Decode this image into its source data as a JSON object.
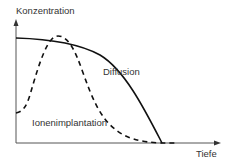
{
  "diagram": {
    "y_axis_label": "Konzentration",
    "x_axis_label": "Tiefe",
    "curves": [
      {
        "name": "Diffusion",
        "style": "solid",
        "label": "Diffusion"
      },
      {
        "name": "Ionenimplantation",
        "style": "dashed",
        "label": "Ionenimplantation"
      }
    ],
    "colors": {
      "line": "#111111",
      "axis": "#555555",
      "text": "#333333"
    }
  }
}
